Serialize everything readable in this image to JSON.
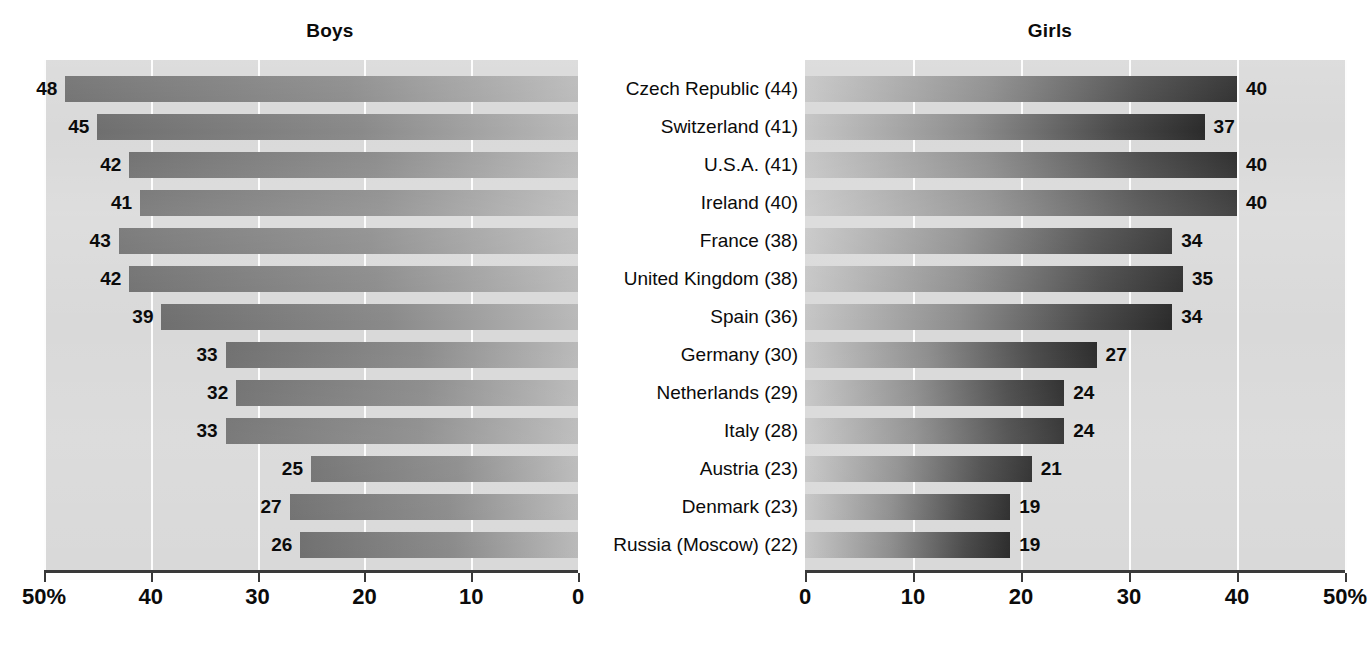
{
  "figure": {
    "panels": [
      {
        "id": "boys",
        "title": "Boys",
        "direction": "right-to-left"
      },
      {
        "id": "girls",
        "title": "Girls",
        "direction": "left-to-right"
      }
    ],
    "axis": {
      "left_ticks": [
        "50%",
        "40",
        "30",
        "20",
        "10",
        "0"
      ],
      "right_ticks": [
        "0",
        "10",
        "20",
        "30",
        "40",
        "50%"
      ],
      "min": 0,
      "max": 50,
      "unit": "%"
    }
  },
  "chart_data": {
    "type": "bar",
    "title": "",
    "subtitle": "",
    "orientation": "horizontal",
    "layout": "back-to-back paired bar chart (pyramid) with shared centered category labels",
    "categories": [
      "Czech Republic (44)",
      "Switzerland (41)",
      "U.S.A. (41)",
      "Ireland (40)",
      "France (38)",
      "United Kingdom (38)",
      "Spain (36)",
      "Germany (30)",
      "Netherlands (29)",
      "Italy (28)",
      "Austria (23)",
      "Denmark (23)",
      "Russia (Moscow) (22)"
    ],
    "series": [
      {
        "name": "Boys",
        "side": "left",
        "values": [
          48,
          45,
          42,
          41,
          43,
          42,
          39,
          33,
          32,
          33,
          25,
          27,
          26
        ]
      },
      {
        "name": "Girls",
        "side": "right",
        "values": [
          40,
          37,
          40,
          40,
          34,
          35,
          34,
          27,
          24,
          24,
          21,
          19,
          19
        ]
      }
    ],
    "xlabel": "",
    "ylabel": "",
    "xlim": [
      0,
      50
    ],
    "xticks": [
      0,
      10,
      20,
      30,
      40,
      50
    ],
    "xtick_labels_left": [
      "50%",
      "40",
      "30",
      "20",
      "10",
      "0"
    ],
    "xtick_labels_right": [
      "0",
      "10",
      "20",
      "30",
      "40",
      "50%"
    ],
    "grid": true,
    "grid_axis": "x",
    "legend": "none",
    "colors": {
      "panel_background": "#d9d9d9",
      "gridline": "#fdfdfd",
      "axis": "#3a3a3a",
      "bar_left_dark": "#6f6f6f",
      "bar_left_light": "#b9b9b9",
      "bar_right_dark": "#2b2b2b",
      "bar_right_light": "#c6c6c6",
      "text": "#0b0b0b"
    }
  }
}
